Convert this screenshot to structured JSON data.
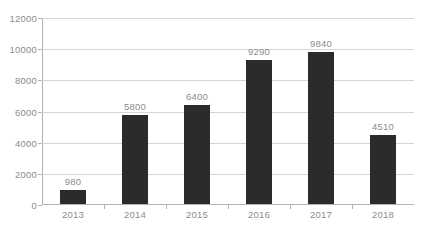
{
  "chart_data": {
    "type": "bar",
    "title": "",
    "subtitle": "",
    "xlabel": "",
    "ylabel": "",
    "categories": [
      "2013",
      "2014",
      "2015",
      "2016",
      "2017",
      "2018"
    ],
    "values": [
      980,
      5800,
      6400,
      9290,
      9840,
      4510
    ],
    "data_labels": [
      "980",
      "5800",
      "6400",
      "9290",
      "9840",
      "4510"
    ],
    "ylim": [
      0,
      12000
    ],
    "yticks": [
      0,
      2000,
      4000,
      6000,
      8000,
      10000,
      12000
    ],
    "ytick_labels": [
      "0",
      "2000",
      "4000",
      "6000",
      "8000",
      "10000",
      "12000"
    ],
    "grid": true,
    "grid_axis": "y",
    "legend": false,
    "legend_position": "none",
    "series": [
      {
        "name": "",
        "values": [
          980,
          5800,
          6400,
          9290,
          9840,
          4510
        ]
      }
    ],
    "colors": {
      "bar": "#2b2b2b",
      "gridline": "#d6d6d6",
      "axis": "#b3b3b3",
      "tick_label": "#8c8c8c",
      "data_label": "#8c8c8c",
      "background": "#ffffff"
    }
  }
}
